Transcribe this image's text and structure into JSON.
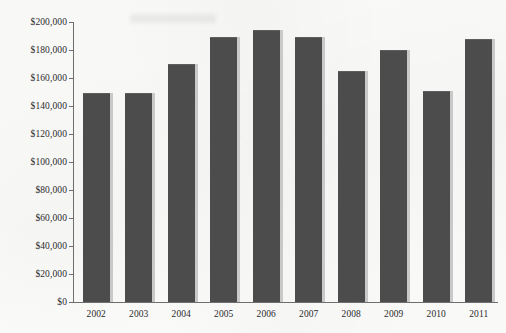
{
  "chart_data": {
    "type": "bar",
    "title": "",
    "subtitle": "",
    "xlabel": "",
    "ylabel": "",
    "categories": [
      "2002",
      "2003",
      "2004",
      "2005",
      "2006",
      "2007",
      "2008",
      "2009",
      "2010",
      "2011"
    ],
    "values": [
      149000,
      149000,
      170000,
      189000,
      194000,
      189000,
      165000,
      180000,
      151000,
      188000
    ],
    "ylim": [
      0,
      200000
    ],
    "ytick_values": [
      0,
      20000,
      40000,
      60000,
      80000,
      100000,
      120000,
      140000,
      160000,
      180000,
      200000
    ],
    "ytick_labels": [
      "$0",
      "$20,000",
      "$40,000",
      "$60,000",
      "$80,000",
      "$100,000",
      "$120,000",
      "$140,000",
      "$160,000",
      "$180,000",
      "$200,000"
    ],
    "grid": false,
    "legend": null,
    "series": [
      {
        "name": "",
        "values": [
          149000,
          149000,
          170000,
          189000,
          194000,
          189000,
          165000,
          180000,
          151000,
          188000
        ]
      }
    ],
    "colors": {
      "bar_fill": "#4c4c4c",
      "bar_shadow": "#c9c9c9",
      "axis": "#6e6e6e",
      "tick_text": "#2b2b2b",
      "background": "#fdfdfc"
    }
  }
}
